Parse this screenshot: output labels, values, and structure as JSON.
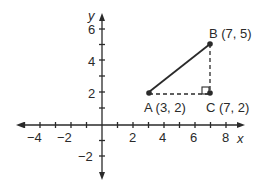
{
  "diagram": {
    "type": "coordinate-plane",
    "axes": {
      "x_label": "x",
      "y_label": "y",
      "x_range": [
        -5,
        9
      ],
      "y_range": [
        -3,
        7
      ],
      "x_tick_labels": [
        "−4",
        "−2",
        "2",
        "4",
        "6",
        "8"
      ],
      "y_tick_labels": [
        "6",
        "4",
        "2",
        "−2"
      ]
    },
    "points": [
      {
        "name": "A",
        "x": 3,
        "y": 2,
        "label": "A (3, 2)"
      },
      {
        "name": "B",
        "x": 7,
        "y": 5,
        "label": "B (7, 5)"
      },
      {
        "name": "C",
        "x": 7,
        "y": 2,
        "label": "C (7, 2)"
      }
    ],
    "segments": [
      {
        "from": "A",
        "to": "B",
        "style": "solid"
      },
      {
        "from": "A",
        "to": "C",
        "style": "dashed"
      },
      {
        "from": "C",
        "to": "B",
        "style": "dashed"
      }
    ],
    "right_angle_at": "C",
    "colors": {
      "ink": "#2a2a2a",
      "background": "#ffffff"
    }
  }
}
